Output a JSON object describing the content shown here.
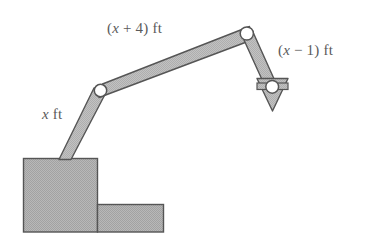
{
  "figure": {
    "background_color": "#ffffff",
    "fill_color": "#b3b3b3",
    "stroke_color": "#555555",
    "text_color": "#5a5a5a",
    "labels": {
      "lower_arm": {
        "prefix": "",
        "variable": "x",
        "suffix": " ft",
        "full": "x ft"
      },
      "middle_arm": {
        "prefix": "(",
        "variable": "x",
        "suffix": " + 4) ft",
        "full": "(x + 4) ft"
      },
      "end_arm": {
        "prefix": "(",
        "variable": "x",
        "suffix": " − 1) ft",
        "full": "(x − 1) ft"
      }
    },
    "parts": {
      "base_large_rect": "base-block-large",
      "base_small_rect": "base-block-small",
      "segment_1": "arm-segment-lower",
      "segment_2": "arm-segment-middle",
      "segment_3": "arm-segment-end",
      "joint_1": "joint-shoulder",
      "joint_2": "joint-elbow",
      "joint_3": "joint-wrist",
      "arrow": "direction-arrow-down"
    }
  }
}
